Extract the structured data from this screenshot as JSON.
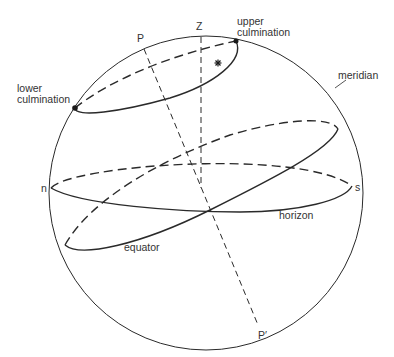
{
  "diagram": {
    "type": "celestial-sphere",
    "colors": {
      "line": "#2a2a2a",
      "text": "#333333",
      "background": "#ffffff"
    },
    "labels": {
      "zenith": "Z",
      "pole": "P",
      "pole_south": "P′",
      "north_point": "n",
      "south_point": "s",
      "upper_culmination_line1": "upper",
      "upper_culmination_line2": "culmination",
      "lower_culmination_line1": "lower",
      "lower_culmination_line2": "culmination",
      "meridian": "meridian",
      "horizon": "horizon",
      "equator": "equator"
    },
    "elements": [
      {
        "name": "meridian",
        "shape": "circle",
        "center": [
          206,
          193
        ],
        "radius": 157
      },
      {
        "name": "horizon",
        "shape": "ellipse",
        "from": "n",
        "to": "s"
      },
      {
        "name": "equator",
        "shape": "ellipse",
        "tilted": true
      },
      {
        "name": "diurnal-circle",
        "shape": "ellipse",
        "from": "lower culmination",
        "to": "upper culmination"
      },
      {
        "name": "polar-axis",
        "shape": "dashed-line",
        "from": "P",
        "to": "P′"
      },
      {
        "name": "zenith-line",
        "shape": "dashed-line",
        "from": "Z",
        "to": "center"
      },
      {
        "name": "star",
        "shape": "star-marker"
      }
    ]
  }
}
